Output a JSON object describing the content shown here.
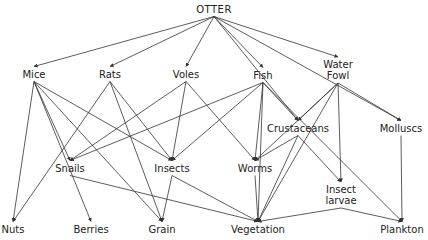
{
  "diagram": {
    "type": "food-web",
    "nodes": [
      {
        "id": "otter",
        "label": "OTTER",
        "x": 214,
        "y": 9
      },
      {
        "id": "mice",
        "label": "Mice",
        "x": 34,
        "y": 74
      },
      {
        "id": "rats",
        "label": "Rats",
        "x": 110,
        "y": 74
      },
      {
        "id": "voles",
        "label": "Voles",
        "x": 186,
        "y": 74
      },
      {
        "id": "fish",
        "label": "Fish",
        "x": 263,
        "y": 75
      },
      {
        "id": "waterfowl",
        "label": "Water\nFowl",
        "x": 338,
        "y": 70
      },
      {
        "id": "crustaceans",
        "label": "Crustaceans",
        "x": 298,
        "y": 128
      },
      {
        "id": "molluscs",
        "label": "Molluscs",
        "x": 401,
        "y": 128
      },
      {
        "id": "snails",
        "label": "Snails",
        "x": 70,
        "y": 168
      },
      {
        "id": "insects",
        "label": "Insects",
        "x": 172,
        "y": 168
      },
      {
        "id": "worms",
        "label": "Worms",
        "x": 255,
        "y": 168
      },
      {
        "id": "insectlarvae",
        "label": "Insect\nlarvae",
        "x": 341,
        "y": 195
      },
      {
        "id": "nuts",
        "label": "Nuts",
        "x": 13,
        "y": 229
      },
      {
        "id": "berries",
        "label": "Berries",
        "x": 91,
        "y": 229
      },
      {
        "id": "grain",
        "label": "Grain",
        "x": 162,
        "y": 229
      },
      {
        "id": "vegetation",
        "label": "Vegetation",
        "x": 258,
        "y": 229
      },
      {
        "id": "plankton",
        "label": "Plankton",
        "x": 402,
        "y": 229
      }
    ],
    "edges": [
      [
        "otter",
        "mice"
      ],
      [
        "otter",
        "rats"
      ],
      [
        "otter",
        "voles"
      ],
      [
        "otter",
        "fish"
      ],
      [
        "otter",
        "waterfowl"
      ],
      [
        "otter",
        "crustaceans"
      ],
      [
        "otter",
        "molluscs"
      ],
      [
        "mice",
        "nuts"
      ],
      [
        "mice",
        "berries"
      ],
      [
        "mice",
        "snails"
      ],
      [
        "mice",
        "grain"
      ],
      [
        "mice",
        "insects"
      ],
      [
        "rats",
        "nuts"
      ],
      [
        "rats",
        "grain"
      ],
      [
        "rats",
        "insects"
      ],
      [
        "voles",
        "snails"
      ],
      [
        "voles",
        "insects"
      ],
      [
        "voles",
        "worms"
      ],
      [
        "fish",
        "snails"
      ],
      [
        "fish",
        "insects"
      ],
      [
        "fish",
        "worms"
      ],
      [
        "fish",
        "vegetation"
      ],
      [
        "fish",
        "crustaceans"
      ],
      [
        "fish",
        "plankton"
      ],
      [
        "waterfowl",
        "crustaceans"
      ],
      [
        "waterfowl",
        "worms"
      ],
      [
        "waterfowl",
        "molluscs"
      ],
      [
        "waterfowl",
        "insectlarvae"
      ],
      [
        "waterfowl",
        "vegetation"
      ],
      [
        "crustaceans",
        "worms"
      ],
      [
        "crustaceans",
        "vegetation"
      ],
      [
        "crustaceans",
        "insectlarvae"
      ],
      [
        "molluscs",
        "plankton"
      ],
      [
        "snails",
        "vegetation"
      ],
      [
        "insects",
        "grain"
      ],
      [
        "insects",
        "vegetation"
      ],
      [
        "worms",
        "vegetation"
      ],
      [
        "insectlarvae",
        "vegetation"
      ],
      [
        "insectlarvae",
        "plankton"
      ]
    ]
  }
}
